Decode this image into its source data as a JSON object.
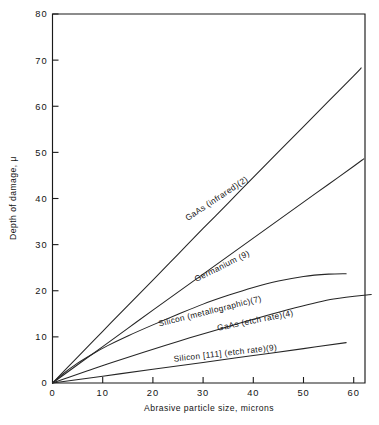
{
  "chart_data": {
    "type": "line",
    "title": "",
    "xlabel": "Abrasive particle size, microns",
    "ylabel": "Depth of damage, μ",
    "xlim": [
      0,
      64.5
    ],
    "ylim": [
      0,
      80
    ],
    "xticks": [
      0,
      10,
      20,
      30,
      40,
      50,
      60
    ],
    "xticklabels": [
      "0",
      "10",
      "20",
      "30",
      "40",
      "50",
      "60"
    ],
    "yticks": [
      0,
      10,
      20,
      30,
      40,
      50,
      60,
      70,
      80
    ],
    "yticklabels": [
      "0",
      "10",
      "20",
      "30",
      "40",
      "50",
      "60",
      "70",
      "80"
    ],
    "grid": false,
    "legend": "inline-curve-labels",
    "series": [
      {
        "name": "GaAs (infrared)(2)",
        "label": "GaAs (infrared)(2)",
        "label_rotation": -33.5,
        "label_x": 33.0,
        "label_y": 39.5,
        "points": [
          [
            0,
            0
          ],
          [
            5,
            5.6
          ],
          [
            10,
            11.2
          ],
          [
            15,
            16.8
          ],
          [
            20,
            22.3
          ],
          [
            25,
            27.9
          ],
          [
            30,
            33.5
          ],
          [
            35,
            39.0
          ],
          [
            40,
            44.6
          ],
          [
            45,
            50.1
          ],
          [
            50,
            55.6
          ],
          [
            55,
            61.1
          ],
          [
            60,
            66.6
          ],
          [
            61.5,
            68.3
          ]
        ]
      },
      {
        "name": "Germanium (9)",
        "label": "Germanium (9)",
        "label_rotation": -26.5,
        "label_x": 34.0,
        "label_y": 24.8,
        "points": [
          [
            0,
            0
          ],
          [
            5,
            3.95
          ],
          [
            10,
            7.9
          ],
          [
            15,
            11.85
          ],
          [
            20,
            15.8
          ],
          [
            25,
            19.7
          ],
          [
            30,
            23.6
          ],
          [
            35,
            27.5
          ],
          [
            40,
            31.4
          ],
          [
            45,
            35.3
          ],
          [
            50,
            39.2
          ],
          [
            55,
            43.1
          ],
          [
            60,
            47.0
          ],
          [
            62.0,
            48.6
          ]
        ]
      },
      {
        "name": "Silicon (metallographic)(7)",
        "label": "Silicon  (metallographic)(7)",
        "label_rotation": -14.0,
        "label_x": 31.5,
        "label_y": 15.0,
        "points": [
          [
            0,
            0
          ],
          [
            2,
            1.9
          ],
          [
            5,
            4.3
          ],
          [
            8,
            6.3
          ],
          [
            11,
            8.1
          ],
          [
            15,
            10.2
          ],
          [
            20,
            12.6
          ],
          [
            25,
            14.9
          ],
          [
            30,
            17.1
          ],
          [
            35,
            19.0
          ],
          [
            40,
            20.7
          ],
          [
            45,
            22.1
          ],
          [
            50,
            23.1
          ],
          [
            55,
            23.6
          ],
          [
            58.5,
            23.7
          ]
        ]
      },
      {
        "name": "GaAs (etch rate)(4)",
        "label": "GaAs (etch rate)(4)",
        "label_rotation": -11.5,
        "label_x": 40.5,
        "label_y": 13.0,
        "points": [
          [
            0,
            0
          ],
          [
            3,
            1.15
          ],
          [
            7,
            2.65
          ],
          [
            12,
            4.5
          ],
          [
            18,
            6.6
          ],
          [
            25,
            9.0
          ],
          [
            32,
            11.3
          ],
          [
            40,
            13.8
          ],
          [
            48,
            16.2
          ],
          [
            56,
            18.2
          ],
          [
            63.5,
            19.2
          ]
        ]
      },
      {
        "name": "Silicon [111] (etch rate)(9)",
        "label": "Silicon [111]  (etch rate)(9)",
        "label_rotation": -6.5,
        "label_x": 34.5,
        "label_y": 5.9,
        "points": [
          [
            0,
            0
          ],
          [
            10,
            1.48
          ],
          [
            20,
            2.96
          ],
          [
            30,
            4.45
          ],
          [
            40,
            5.95
          ],
          [
            50,
            7.45
          ],
          [
            58.5,
            8.75
          ]
        ]
      }
    ]
  }
}
